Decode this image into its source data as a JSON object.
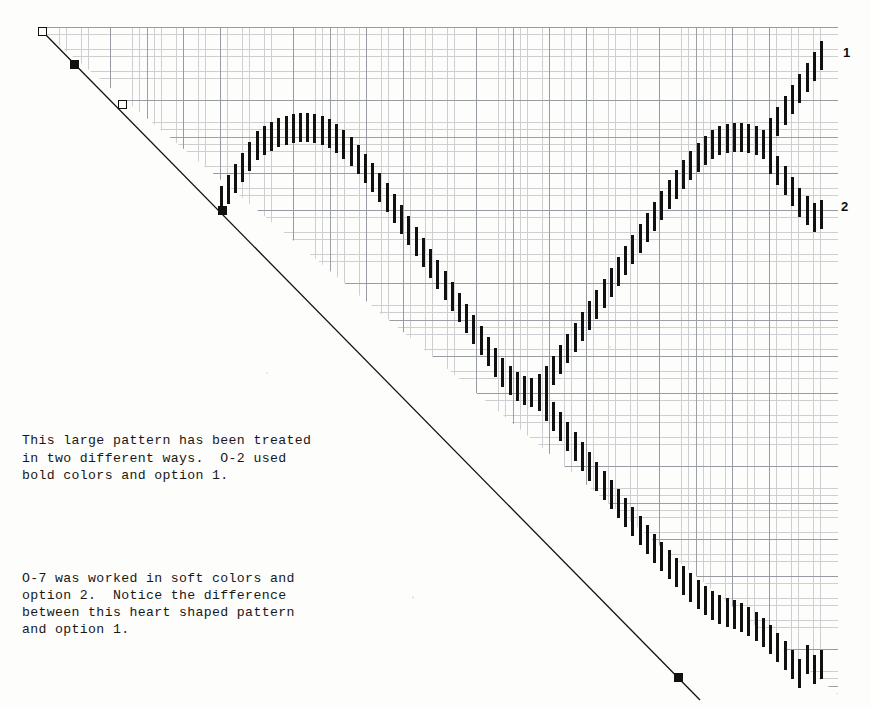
{
  "page": {
    "background_color": "#fdfdfc",
    "ink_color": "#111111",
    "grid_fine_color": "#b9bcc2",
    "grid_coarse_color": "#8d9199"
  },
  "grid": {
    "name": "graph-paper",
    "left": 37,
    "top": 27,
    "width": 801,
    "height": 667,
    "fine_cell_px": 7.32,
    "coarse_cell_px": 36.6,
    "fine_per_coarse": 5,
    "clipped": "upper-right triangle above the diagonal baseline"
  },
  "baseline": {
    "name": "diagonal-guide-line",
    "from": [
      42,
      31
    ],
    "to": [
      700,
      700
    ],
    "stroke": "#111111",
    "stroke_width": 1.3
  },
  "markers": [
    {
      "name": "marker-open-1",
      "type": "open",
      "x": 42,
      "y": 31
    },
    {
      "name": "marker-filled-1",
      "type": "filled",
      "x": 74,
      "y": 64
    },
    {
      "name": "marker-open-2",
      "type": "open",
      "x": 122,
      "y": 104
    },
    {
      "name": "marker-filled-2",
      "type": "filled",
      "x": 222,
      "y": 210
    },
    {
      "name": "marker-filled-3",
      "type": "filled",
      "x": 678,
      "y": 677
    }
  ],
  "edge_labels": [
    {
      "name": "option-1-label",
      "text": "1",
      "x": 843,
      "y": 46
    },
    {
      "name": "option-2-label",
      "text": "2",
      "x": 841,
      "y": 200
    }
  ],
  "caption": {
    "paragraph_1": "This large pattern has been treated\nin two different ways.  O-2 used\nbold colors and option 1.",
    "paragraph_2": "O-7 was worked in soft colors and\noption 2.  Notice the difference\nbetween this heart shaped pattern\nand option 1."
  },
  "chart_data": {
    "type": "scatter",
    "dash_width_px": 3,
    "dash_height_px": 29,
    "column_pitch_px": 7.32,
    "title": "",
    "xlabel": "",
    "ylabel": "",
    "strands": [
      {
        "name": "main-heart-contour",
        "comment": "x,y are the TOP-LEFT pixel of each dash, left to right",
        "points": [
          [
            220,
            186
          ],
          [
            227,
            175
          ],
          [
            234,
            164
          ],
          [
            241,
            153
          ],
          [
            248,
            142
          ],
          [
            256,
            131
          ],
          [
            263,
            126
          ],
          [
            270,
            122
          ],
          [
            277,
            118
          ],
          [
            285,
            116
          ],
          [
            292,
            114
          ],
          [
            299,
            113
          ],
          [
            306,
            113
          ],
          [
            313,
            114
          ],
          [
            321,
            116
          ],
          [
            328,
            119
          ],
          [
            335,
            124
          ],
          [
            342,
            130
          ],
          [
            350,
            137
          ],
          [
            357,
            145
          ],
          [
            364,
            154
          ],
          [
            371,
            163
          ],
          [
            378,
            173
          ],
          [
            386,
            183
          ],
          [
            393,
            194
          ],
          [
            400,
            205
          ],
          [
            407,
            216
          ],
          [
            415,
            227
          ],
          [
            422,
            238
          ],
          [
            429,
            249
          ],
          [
            436,
            260
          ],
          [
            444,
            271
          ],
          [
            451,
            282
          ],
          [
            458,
            293
          ],
          [
            465,
            304
          ],
          [
            472,
            315
          ],
          [
            480,
            326
          ],
          [
            487,
            337
          ],
          [
            494,
            348
          ],
          [
            501,
            358
          ],
          [
            509,
            366
          ],
          [
            516,
            372
          ],
          [
            523,
            376
          ],
          [
            530,
            378
          ],
          [
            538,
            374
          ],
          [
            545,
            366
          ],
          [
            552,
            356
          ],
          [
            559,
            345
          ],
          [
            566,
            334
          ],
          [
            574,
            323
          ],
          [
            581,
            312
          ],
          [
            588,
            301
          ],
          [
            595,
            290
          ],
          [
            603,
            279
          ],
          [
            610,
            268
          ],
          [
            617,
            257
          ],
          [
            624,
            246
          ],
          [
            631,
            235
          ],
          [
            639,
            224
          ],
          [
            646,
            213
          ],
          [
            653,
            202
          ],
          [
            660,
            191
          ],
          [
            668,
            180
          ],
          [
            675,
            170
          ],
          [
            682,
            160
          ],
          [
            689,
            151
          ],
          [
            697,
            143
          ],
          [
            704,
            136
          ],
          [
            711,
            130
          ],
          [
            718,
            126
          ],
          [
            726,
            124
          ],
          [
            733,
            123
          ],
          [
            740,
            123
          ],
          [
            747,
            124
          ],
          [
            755,
            126
          ],
          [
            762,
            130
          ]
        ]
      },
      {
        "name": "option-1-branch-ascending",
        "comment": "upper right-hand branch, ends at edge label 1",
        "points": [
          [
            769,
            118
          ],
          [
            776,
            107
          ],
          [
            784,
            96
          ],
          [
            791,
            85
          ],
          [
            798,
            74
          ],
          [
            806,
            63
          ],
          [
            813,
            52
          ],
          [
            820,
            41
          ]
        ]
      },
      {
        "name": "option-2-branch-descending",
        "comment": "lower right-hand branch, ends at edge label 2",
        "points": [
          [
            769,
            145
          ],
          [
            776,
            156
          ],
          [
            784,
            166
          ],
          [
            791,
            177
          ],
          [
            798,
            188
          ],
          [
            806,
            196
          ],
          [
            813,
            203
          ],
          [
            820,
            200
          ]
        ]
      },
      {
        "name": "lower-descending-tail",
        "comment": "long run from the centre valley down to the bottom-right corner",
        "points": [
          [
            538,
            382
          ],
          [
            545,
            392
          ],
          [
            552,
            402
          ],
          [
            559,
            412
          ],
          [
            566,
            422
          ],
          [
            574,
            432
          ],
          [
            581,
            442
          ],
          [
            588,
            452
          ],
          [
            595,
            462
          ],
          [
            603,
            471
          ],
          [
            610,
            480
          ],
          [
            617,
            489
          ],
          [
            624,
            498
          ],
          [
            631,
            507
          ],
          [
            639,
            516
          ],
          [
            646,
            525
          ],
          [
            653,
            534
          ],
          [
            660,
            542
          ],
          [
            668,
            550
          ],
          [
            675,
            558
          ],
          [
            682,
            566
          ],
          [
            689,
            573
          ],
          [
            697,
            580
          ],
          [
            704,
            586
          ],
          [
            711,
            591
          ],
          [
            718,
            595
          ],
          [
            726,
            598
          ],
          [
            733,
            600
          ],
          [
            740,
            603
          ],
          [
            747,
            607
          ],
          [
            755,
            612
          ],
          [
            762,
            618
          ],
          [
            769,
            625
          ],
          [
            776,
            633
          ],
          [
            784,
            641
          ],
          [
            791,
            650
          ],
          [
            798,
            659
          ],
          [
            806,
            645
          ],
          [
            813,
            655
          ],
          [
            820,
            650
          ]
        ]
      }
    ]
  }
}
